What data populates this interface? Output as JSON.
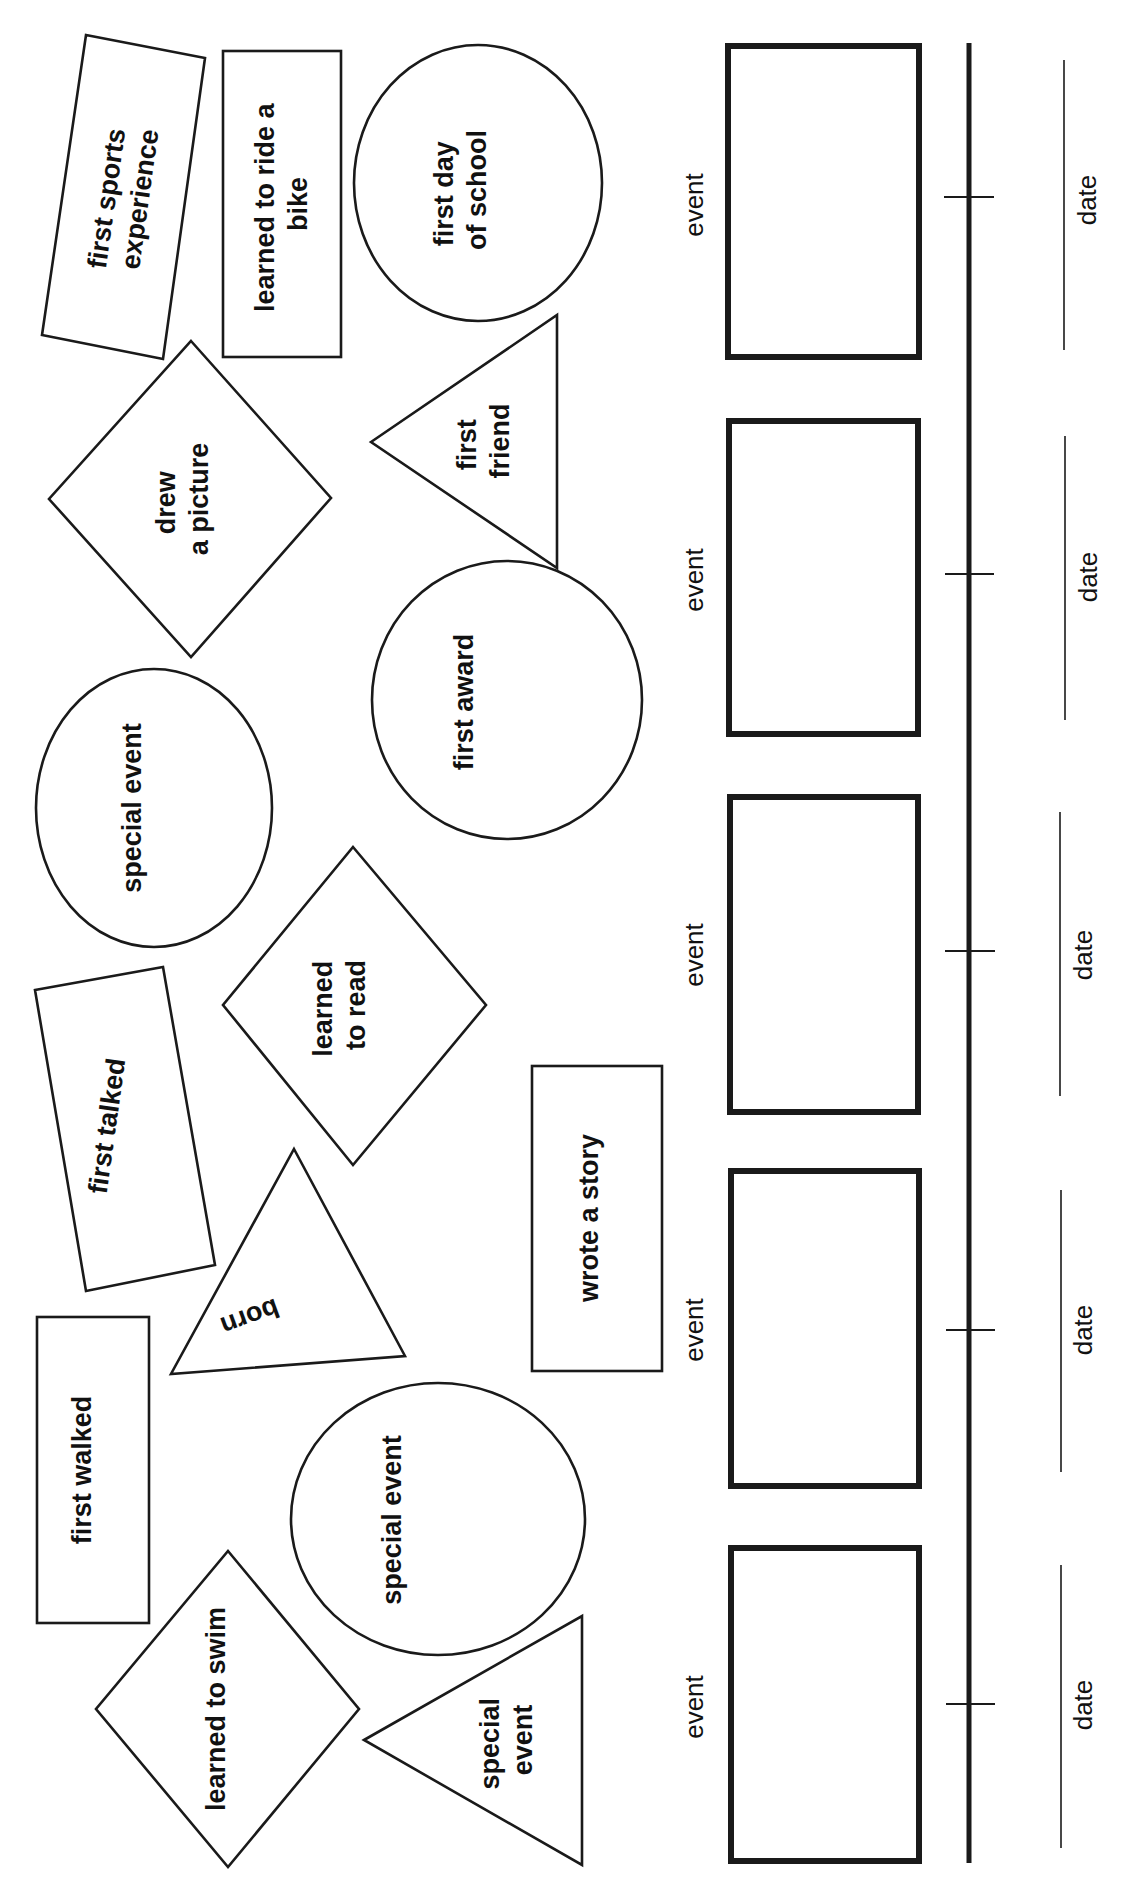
{
  "worksheet": {
    "cutouts": [
      {
        "id": "first-sports-experience",
        "shape": "rectangle",
        "lines": [
          "first sports",
          "experience"
        ]
      },
      {
        "id": "learned-to-ride-a-bike",
        "shape": "rectangle",
        "lines": [
          "learned to ride a",
          "bike"
        ]
      },
      {
        "id": "first-day-of-school",
        "shape": "circle",
        "lines": [
          "first day",
          "of school"
        ]
      },
      {
        "id": "drew-a-picture",
        "shape": "diamond",
        "lines": [
          "drew",
          "a picture"
        ]
      },
      {
        "id": "first-friend",
        "shape": "triangle",
        "lines": [
          "first",
          "friend"
        ]
      },
      {
        "id": "special-event-1",
        "shape": "circle",
        "lines": [
          "special event"
        ]
      },
      {
        "id": "first-award",
        "shape": "circle",
        "lines": [
          "first award"
        ]
      },
      {
        "id": "learned-to-read",
        "shape": "diamond",
        "lines": [
          "learned",
          "to read"
        ]
      },
      {
        "id": "first-talked",
        "shape": "rectangle",
        "lines": [
          "first talked"
        ]
      },
      {
        "id": "wrote-a-story",
        "shape": "rectangle",
        "lines": [
          "wrote a story"
        ]
      },
      {
        "id": "born",
        "shape": "triangle",
        "lines": [
          "born"
        ]
      },
      {
        "id": "first-walked",
        "shape": "rectangle",
        "lines": [
          "first walked"
        ]
      },
      {
        "id": "special-event-2",
        "shape": "circle",
        "lines": [
          "special event"
        ]
      },
      {
        "id": "learned-to-swim",
        "shape": "diamond",
        "lines": [
          "learned to swim"
        ]
      },
      {
        "id": "special-event-3",
        "shape": "triangle",
        "lines": [
          "special",
          "event"
        ]
      }
    ],
    "timeline": {
      "slots": [
        {
          "event_label": "event",
          "date_label": "date"
        },
        {
          "event_label": "event",
          "date_label": "date"
        },
        {
          "event_label": "event",
          "date_label": "date"
        },
        {
          "event_label": "event",
          "date_label": "date"
        },
        {
          "event_label": "event",
          "date_label": "date"
        }
      ]
    },
    "colors": {
      "ink": "#1a1a1a",
      "paper": "#ffffff"
    }
  }
}
